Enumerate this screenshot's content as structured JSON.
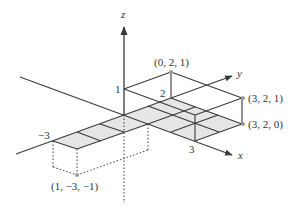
{
  "diagram": {
    "type": "3d-coordinate-axes",
    "axes": {
      "x_label": "x",
      "y_label": "y",
      "z_label": "z"
    },
    "tick_labels": {
      "z_1": "1",
      "y_2": "2",
      "x_3": "3",
      "y_neg3": "−3"
    },
    "points": [
      {
        "label": "(0, 2, 1)",
        "coords": [
          0,
          2,
          1
        ]
      },
      {
        "label": "(3, 2, 1)",
        "coords": [
          3,
          2,
          1
        ]
      },
      {
        "label": "(3, 2, 0)",
        "coords": [
          3,
          2,
          0
        ]
      },
      {
        "label": "(1, −3, −1)",
        "coords": [
          1,
          -3,
          -1
        ]
      }
    ],
    "shaded_regions": [
      {
        "x_range": [
          0,
          3
        ],
        "y_range": [
          0,
          2
        ],
        "z": 0
      },
      {
        "x_range": [
          0,
          1
        ],
        "y_range": [
          -3,
          0
        ],
        "z": 0
      }
    ],
    "box": {
      "x_range": [
        0,
        3
      ],
      "y_range": [
        0,
        2
      ],
      "z_range": [
        0,
        1
      ]
    },
    "colors": {
      "line": "#3a3a3a",
      "shade": "#e6e6e6",
      "point": "#9a9a9a"
    }
  }
}
